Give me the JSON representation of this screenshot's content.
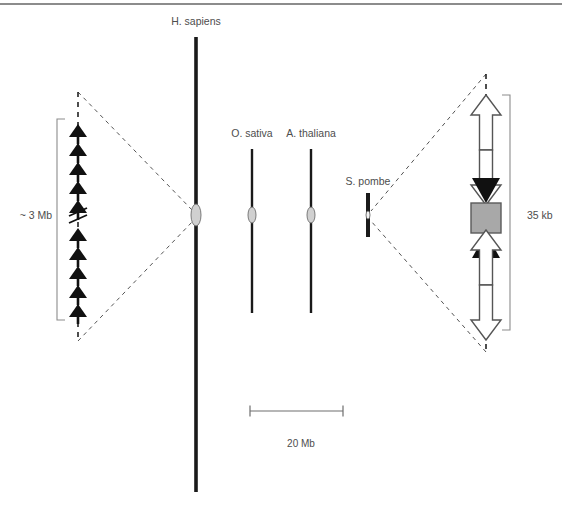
{
  "figure": {
    "background_color": "#ffffff",
    "top_rule_color": "#8c8c8c",
    "chromosome_color": "#1a1a1a",
    "centromere_fill": "#d0d0d0",
    "centromere_stroke": "#6e6e6e",
    "bracket_color": "#8c8c8c",
    "dashed_leader_color": "#555555",
    "black_arrow_color": "#111111",
    "white_arrow_fill": "#ffffff",
    "white_arrow_stroke": "#555555",
    "gray_box_fill": "#a8a8a8",
    "gray_box_stroke": "#5a5a5a",
    "label_color": "#4d4d4d"
  },
  "species": [
    {
      "id": "h-sapiens",
      "label": "H. sapiens",
      "label_x": 196,
      "label_y": 25,
      "axis_x": 196,
      "axis_top": 37,
      "axis_bottom": 492,
      "axis_width": 3.6,
      "centromere_y": 215,
      "centromere_rx": 5,
      "centromere_ry": 11
    },
    {
      "id": "o-sativa",
      "label": "O. sativa",
      "label_x": 252,
      "label_y": 137,
      "axis_x": 252,
      "axis_top": 149,
      "axis_bottom": 313,
      "axis_width": 2.4,
      "centromere_y": 215,
      "centromere_rx": 4,
      "centromere_ry": 8
    },
    {
      "id": "a-thaliana",
      "label": "A. thaliana",
      "label_x": 311,
      "label_y": 137,
      "axis_x": 311,
      "axis_top": 149,
      "axis_bottom": 313,
      "axis_width": 2.4,
      "centromere_y": 215,
      "centromere_rx": 4,
      "centromere_ry": 8
    },
    {
      "id": "s-pombe",
      "label": "S. pombe",
      "label_x": 368,
      "label_y": 185,
      "axis_x": 368,
      "axis_top": 193,
      "axis_bottom": 237,
      "axis_width": 4,
      "centromere_y": 215,
      "centromere_rx": 2,
      "centromere_ry": 4
    }
  ],
  "left_detail": {
    "name": "human-centromere-expansion",
    "measure_label": "~ 3 Mb",
    "measure_label_x": 36,
    "measure_label_y": 219,
    "axis_x": 78,
    "dashed_top": 92,
    "dashed_bottom": 341,
    "bracket_x": 57,
    "bracket_top": 119,
    "bracket_bottom": 320,
    "bracket_tick": 8,
    "arrow_count_upper": 5,
    "arrow_count_lower": 5,
    "arrows_upper_y": [
      124,
      143,
      162,
      181,
      200
    ],
    "arrows_lower_y": [
      228,
      247,
      266,
      285,
      304
    ],
    "arrow_half_width": 9,
    "arrow_head_height": 13,
    "break_y": 212,
    "leaders": [
      {
        "x1": 78,
        "y1": 92,
        "x2": 193,
        "y2": 211
      },
      {
        "x1": 78,
        "y1": 341,
        "x2": 193,
        "y2": 221
      }
    ]
  },
  "right_detail": {
    "name": "pombe-centromere-expansion",
    "measure_label": "35 kb",
    "measure_label_x": 527,
    "measure_label_y": 219,
    "axis_x": 486,
    "dashed_top": 74,
    "dashed_bottom": 352,
    "bracket_x": 510,
    "bracket_top": 95,
    "bracket_bottom": 330,
    "bracket_tick": 8,
    "gray_box": {
      "x": 471,
      "y": 203,
      "width": 30,
      "height": 30
    },
    "elements": [
      {
        "type": "white-arrow",
        "direction": "up",
        "top": 95,
        "bottom": 150
      },
      {
        "type": "white-arrow",
        "direction": "down",
        "top": 150,
        "bottom": 205
      },
      {
        "type": "black-arrow",
        "direction": "down",
        "top": 178,
        "bottom": 203
      },
      {
        "type": "gray-box",
        "top": 203,
        "bottom": 233
      },
      {
        "type": "black-arrow",
        "direction": "up",
        "top": 233,
        "bottom": 258
      },
      {
        "type": "white-arrow",
        "direction": "up",
        "top": 230,
        "bottom": 285
      },
      {
        "type": "white-arrow",
        "direction": "down",
        "top": 285,
        "bottom": 340
      }
    ],
    "leaders": [
      {
        "x1": 486,
        "y1": 74,
        "x2": 371,
        "y2": 211
      },
      {
        "x1": 486,
        "y1": 352,
        "x2": 371,
        "y2": 221
      }
    ]
  },
  "scale_bar": {
    "name": "scale-bar",
    "label": "20 Mb",
    "label_x": 301,
    "label_y": 447,
    "x1": 250,
    "x2": 343,
    "y": 411,
    "tick_height": 11,
    "color": "#6e6e6e"
  },
  "top_rule": {
    "x1": 0,
    "x2": 562,
    "y": 4
  }
}
